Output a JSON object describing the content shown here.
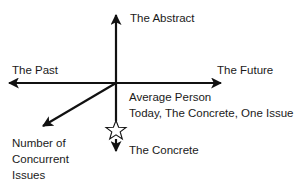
{
  "diagram": {
    "type": "axes-diagram",
    "axes": {
      "vertical_up": {
        "label": "The Abstract"
      },
      "vertical_down": {
        "label": "The Concrete"
      },
      "horizontal_left": {
        "label": "The Past"
      },
      "horizontal_right": {
        "label": "The Future"
      },
      "diagonal": {
        "label_lines": [
          "Number of",
          "Concurrent",
          "Issues"
        ]
      }
    },
    "marker": {
      "shape": "star",
      "label_lines": [
        "Average Person",
        "Today, The Concrete, One Issue"
      ]
    },
    "colors": {
      "line": "#111111",
      "text": "#1a1a1a",
      "background": "#ffffff"
    }
  }
}
